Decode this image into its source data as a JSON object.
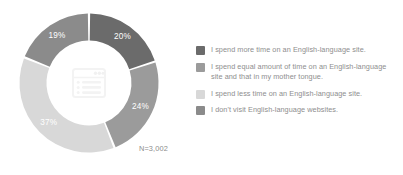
{
  "chart_data": {
    "type": "pie",
    "variant": "donut",
    "title": "",
    "subtitle": "",
    "xlabel": "",
    "ylabel": "",
    "start_angle_deg": 0,
    "direction": "clockwise",
    "grid": false,
    "legend_position": "right",
    "categories": [
      "I spend more time on an English-language site.",
      "I spend equal amount of time on an English-language site and that in my mother tongue.",
      "I spend less time on an English-language site.",
      "I don't visit English-language websites."
    ],
    "values": [
      20,
      24,
      37,
      19
    ],
    "value_labels": [
      "20%",
      "24%",
      "37%",
      "19%"
    ],
    "colors": [
      "#6b6b6b",
      "#9b9b9b",
      "#d8d8d8",
      "#8b8b8b"
    ],
    "annotations": [
      "N=3,002"
    ],
    "units": "percent",
    "total_responses": "3,002"
  },
  "donut": {
    "slices": [
      {
        "label": "20%",
        "value": 20,
        "color": "#6b6b6b",
        "label_fill": "#ffffff"
      },
      {
        "label": "24%",
        "value": 24,
        "color": "#9b9b9b",
        "label_fill": "#ffffff"
      },
      {
        "label": "37%",
        "value": 37,
        "color": "#d8d8d8",
        "label_fill": "#ffffff"
      },
      {
        "label": "19%",
        "value": 19,
        "color": "#8b8b8b",
        "label_fill": "#ffffff"
      }
    ],
    "sample_size": "N=3,002",
    "center_icon": "browser-window-icon"
  },
  "legend": {
    "items": [
      {
        "color": "#6b6b6b",
        "label": "I spend more time on an English-language site."
      },
      {
        "color": "#9b9b9b",
        "label": "I spend equal amount of time on an English-language site and that in my mother tongue."
      },
      {
        "color": "#d8d8d8",
        "label": "I spend less time on an English-language site."
      },
      {
        "color": "#8b8b8b",
        "label": "I don't visit English-language websites."
      }
    ]
  }
}
